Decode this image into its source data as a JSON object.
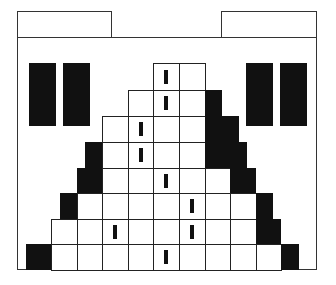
{
  "game": {
    "colors": {
      "line": "#222222",
      "fill": "#111111",
      "background": "#ffffff"
    },
    "tabs": [
      {
        "name": "left-tab",
        "label": ""
      },
      {
        "name": "right-tab",
        "label": ""
      }
    ],
    "grid": {
      "col_edges": [
        26,
        51,
        77,
        102,
        128,
        153,
        179,
        205,
        230,
        256,
        281,
        307
      ],
      "row_edges": [
        63,
        90,
        116,
        142,
        168,
        193,
        219,
        244,
        270
      ],
      "rows": [
        {
          "cells": [
            5,
            6
          ],
          "ticks": [
            5
          ]
        },
        {
          "cells": [
            4,
            5,
            6
          ],
          "ticks": [
            5
          ]
        },
        {
          "cells": [
            3,
            4,
            5,
            6
          ],
          "ticks": [
            4
          ]
        },
        {
          "cells": [
            3,
            4,
            5,
            6
          ],
          "ticks": [
            4
          ]
        },
        {
          "cells": [
            3,
            4,
            5,
            6,
            7
          ],
          "ticks": [
            5
          ]
        },
        {
          "cells": [
            2,
            3,
            4,
            5,
            6,
            7,
            8
          ],
          "ticks": [
            6
          ]
        },
        {
          "cells": [
            1,
            2,
            3,
            4,
            5,
            6,
            7,
            8
          ],
          "ticks": [
            3,
            6
          ]
        },
        {
          "cells": [
            1,
            2,
            3,
            4,
            5,
            6,
            7,
            8,
            9
          ],
          "ticks": [
            5
          ]
        }
      ]
    },
    "black_blocks": [
      {
        "x": 205,
        "y": 90,
        "w": 17,
        "h": 26
      },
      {
        "x": 205,
        "y": 116,
        "w": 34,
        "h": 26
      },
      {
        "x": 205,
        "y": 142,
        "w": 42,
        "h": 26
      },
      {
        "x": 230,
        "y": 168,
        "w": 26,
        "h": 25
      },
      {
        "x": 256,
        "y": 193,
        "w": 17,
        "h": 26
      },
      {
        "x": 256,
        "y": 219,
        "w": 25,
        "h": 25
      },
      {
        "x": 281,
        "y": 244,
        "w": 18,
        "h": 26
      },
      {
        "x": 85,
        "y": 142,
        "w": 17,
        "h": 26
      },
      {
        "x": 77,
        "y": 168,
        "w": 25,
        "h": 25
      },
      {
        "x": 60,
        "y": 193,
        "w": 17,
        "h": 26
      },
      {
        "x": 26,
        "y": 244,
        "w": 25,
        "h": 26
      }
    ],
    "side_bars": [
      {
        "name": "left-bar-1",
        "x": 29,
        "y": 63,
        "w": 27,
        "h": 63
      },
      {
        "name": "left-bar-2",
        "x": 63,
        "y": 63,
        "w": 27,
        "h": 63
      },
      {
        "name": "right-bar-1",
        "x": 246,
        "y": 63,
        "w": 27,
        "h": 63
      },
      {
        "name": "right-bar-2",
        "x": 280,
        "y": 63,
        "w": 27,
        "h": 63
      }
    ]
  }
}
